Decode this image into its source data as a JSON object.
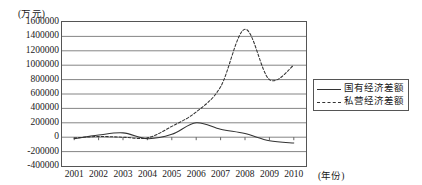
{
  "chart_data": {
    "type": "line",
    "title": "",
    "xlabel": "(年份)",
    "ylabel": "(万元)",
    "categories": [
      "2001",
      "2002",
      "2003",
      "2004",
      "2005",
      "2006",
      "2007",
      "2008",
      "2009",
      "2010"
    ],
    "ylim": [
      -400000,
      1600000
    ],
    "ytick_step": 200000,
    "yticks": [
      "1600000",
      "1400000",
      "1200000",
      "1000000",
      "800000",
      "600000",
      "400000",
      "200000",
      "0",
      "-200000",
      "-400000"
    ],
    "ytick_values": [
      1600000,
      1400000,
      1200000,
      1000000,
      800000,
      600000,
      400000,
      200000,
      0,
      -200000,
      -400000
    ],
    "grid": "horizontal",
    "legend_position": "right-middle",
    "series": [
      {
        "name": "国有经济差额",
        "style": "solid",
        "color": "#333333",
        "values": [
          -20000,
          30000,
          60000,
          -20000,
          40000,
          200000,
          110000,
          50000,
          -50000,
          -80000
        ]
      },
      {
        "name": "私营经济差额",
        "style": "dashed",
        "color": "#333333",
        "values": [
          -10000,
          10000,
          0,
          -10000,
          150000,
          350000,
          700000,
          1500000,
          800000,
          1000000
        ]
      }
    ]
  }
}
